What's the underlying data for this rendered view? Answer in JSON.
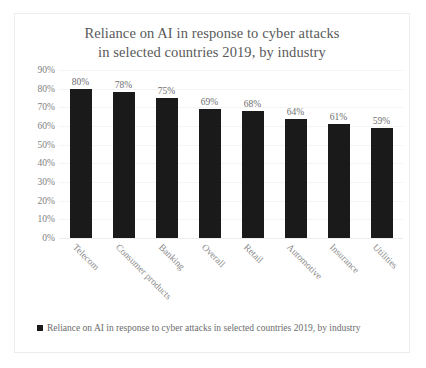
{
  "chart_data": {
    "type": "bar",
    "title": "Reliance on AI in response to cyber attacks\nin selected countries 2019, by industry",
    "title_line1": "Reliance on AI in response to cyber attacks",
    "title_line2": "in selected countries 2019, by industry",
    "categories": [
      "Telecom",
      "Consumer products",
      "Banking",
      "Overall",
      "Retail",
      "Automotive",
      "Insurance",
      "Utilities"
    ],
    "values": [
      80,
      78,
      75,
      69,
      68,
      64,
      61,
      59
    ],
    "value_labels": [
      "80%",
      "78%",
      "75%",
      "69%",
      "68%",
      "64%",
      "61%",
      "59%"
    ],
    "series": [
      {
        "name": "Reliance on AI in response to cyber attacks in selected countries 2019, by industry",
        "values": [
          80,
          78,
          75,
          69,
          68,
          64,
          61,
          59
        ],
        "color": "#1a1a1a"
      }
    ],
    "xlabel": "",
    "ylabel": "",
    "ylim": [
      0,
      90
    ],
    "ytick_labels": [
      "90%",
      "80%",
      "70%",
      "60%",
      "50%",
      "40%",
      "30%",
      "20%",
      "10%",
      "0%"
    ],
    "ytick_values": [
      90,
      80,
      70,
      60,
      50,
      40,
      30,
      20,
      10,
      0
    ],
    "grid": true,
    "legend_position": "bottom-left",
    "legend_label": "Reliance on AI in response to cyber attacks in selected countries 2019, by industry",
    "bar_color": "#1a1a1a",
    "text_color": "#808080",
    "title_color": "#595959",
    "background_color": "#ffffff",
    "border_color": "#ececec"
  }
}
